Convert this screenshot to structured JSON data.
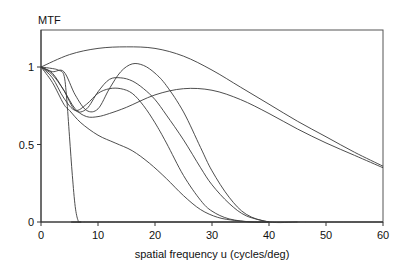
{
  "chart_data": {
    "type": "line",
    "title": "",
    "ylabel": "MTF",
    "xlabel": "spatial frequency u (cycles/deg)",
    "xlim": [
      0,
      60
    ],
    "ylim": [
      0,
      1.22
    ],
    "grid": false,
    "legend": null,
    "x_ticks": [
      0,
      10,
      20,
      30,
      40,
      50,
      60
    ],
    "x_tick_labels": [
      "0",
      "10",
      "20",
      "30",
      "40",
      "50",
      "60"
    ],
    "y_ticks": [
      0,
      0.5,
      1
    ],
    "y_tick_labels": [
      "0",
      "0.5",
      "1"
    ],
    "series": [
      {
        "name": "curve-1-steep-cutoff",
        "x": [
          0,
          2,
          3,
          4,
          4.5,
          5,
          5.5,
          6,
          6.5,
          7,
          10,
          60
        ],
        "y": [
          1.0,
          0.99,
          0.98,
          0.95,
          0.8,
          0.55,
          0.3,
          0.1,
          0.01,
          0,
          0,
          0
        ]
      },
      {
        "name": "curve-2-broad-arc",
        "x": [
          0,
          5,
          10,
          15,
          20,
          25,
          30,
          35,
          40,
          45,
          50,
          55,
          60
        ],
        "y": [
          1.0,
          1.08,
          1.12,
          1.13,
          1.12,
          1.07,
          0.98,
          0.87,
          0.76,
          0.65,
          0.55,
          0.45,
          0.36
        ]
      },
      {
        "name": "curve-3-low-dip-late-peak",
        "x": [
          0,
          2,
          4,
          6,
          8,
          10,
          12,
          15,
          20,
          25,
          30,
          35,
          40,
          45,
          50,
          55,
          60
        ],
        "y": [
          1.0,
          0.96,
          0.85,
          0.73,
          0.68,
          0.68,
          0.7,
          0.74,
          0.82,
          0.86,
          0.85,
          0.79,
          0.7,
          0.6,
          0.51,
          0.43,
          0.35
        ]
      },
      {
        "name": "curve-4-peak-1.02",
        "x": [
          0,
          2,
          4,
          6,
          8,
          10,
          12,
          14,
          16,
          18,
          20,
          22,
          25,
          28,
          30,
          33,
          36,
          40,
          45
        ],
        "y": [
          1.0,
          0.97,
          0.97,
          0.82,
          0.72,
          0.73,
          0.86,
          0.97,
          1.02,
          1.01,
          0.96,
          0.88,
          0.71,
          0.48,
          0.33,
          0.16,
          0.05,
          0.0,
          0.0
        ]
      },
      {
        "name": "curve-5-peak-0.93",
        "x": [
          0,
          2,
          4,
          6,
          8,
          10,
          12,
          14,
          16,
          18,
          20,
          22,
          25,
          28,
          30,
          33,
          36,
          40
        ],
        "y": [
          1.0,
          0.95,
          0.85,
          0.72,
          0.73,
          0.84,
          0.92,
          0.93,
          0.91,
          0.86,
          0.79,
          0.69,
          0.53,
          0.35,
          0.24,
          0.12,
          0.04,
          0.0
        ]
      },
      {
        "name": "curve-6-peak-0.86",
        "x": [
          0,
          2,
          4,
          6,
          8,
          10,
          12,
          14,
          16,
          18,
          20,
          22,
          25,
          28,
          30,
          33,
          37,
          40
        ],
        "y": [
          1.0,
          0.93,
          0.8,
          0.72,
          0.76,
          0.83,
          0.86,
          0.86,
          0.83,
          0.75,
          0.64,
          0.51,
          0.3,
          0.14,
          0.07,
          0.02,
          0.0,
          0.0
        ]
      },
      {
        "name": "curve-7-monotonic-decline",
        "x": [
          0,
          2,
          4,
          5,
          7,
          10,
          13,
          16,
          19,
          22,
          25,
          28,
          31,
          34,
          37,
          40
        ],
        "y": [
          1.0,
          0.9,
          0.76,
          0.72,
          0.64,
          0.56,
          0.51,
          0.46,
          0.38,
          0.28,
          0.17,
          0.08,
          0.03,
          0.01,
          0.0,
          0.0
        ]
      }
    ],
    "colors": {
      "line": "#3a3a3a",
      "axis": "#333333",
      "background": "#ffffff"
    }
  },
  "labels": {
    "y_axis_title": "MTF",
    "x_axis_title": "spatial frequency u (cycles/deg)"
  }
}
